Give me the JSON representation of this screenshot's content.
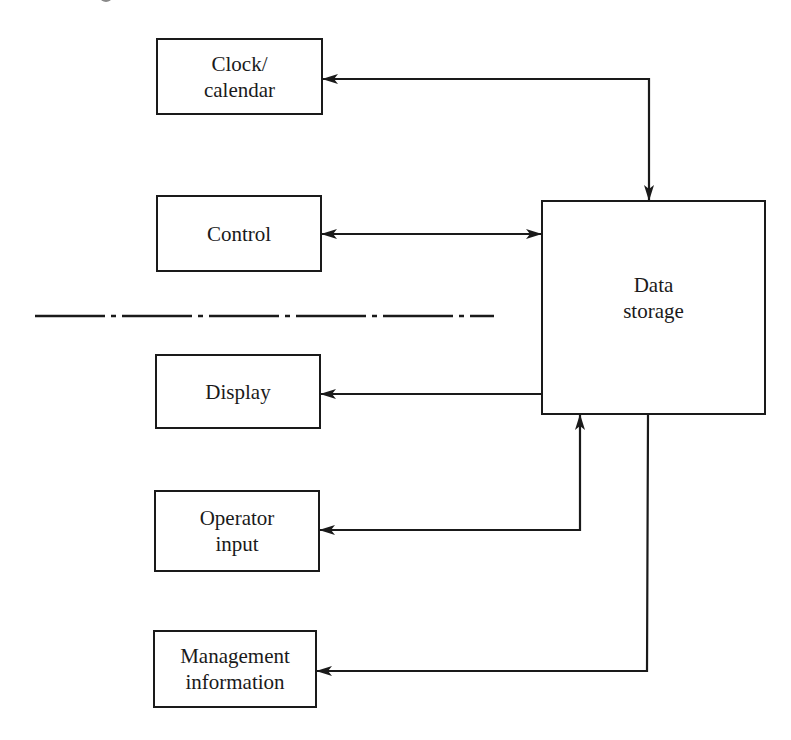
{
  "diagram": {
    "title": "",
    "colors": {
      "stroke": "#1a1a1a",
      "background": "#ffffff"
    },
    "nodes": [
      {
        "id": "clock",
        "lines": [
          "Clock/",
          "calendar"
        ],
        "x": 156,
        "y": 38,
        "w": 167,
        "h": 77
      },
      {
        "id": "control",
        "lines": [
          "Control"
        ],
        "x": 156,
        "y": 195,
        "w": 166,
        "h": 77
      },
      {
        "id": "display",
        "lines": [
          "Display"
        ],
        "x": 155,
        "y": 354,
        "w": 166,
        "h": 75
      },
      {
        "id": "operator",
        "lines": [
          "Operator",
          "input"
        ],
        "x": 154,
        "y": 490,
        "w": 166,
        "h": 82
      },
      {
        "id": "management",
        "lines": [
          "Management",
          "information"
        ],
        "x": 153,
        "y": 630,
        "w": 164,
        "h": 78
      },
      {
        "id": "storage",
        "lines": [
          "Data",
          "storage"
        ],
        "x": 541,
        "y": 200,
        "w": 225,
        "h": 215
      }
    ],
    "edges": [
      {
        "from": "storage",
        "to": "clock",
        "direction": "bidirectional",
        "description": "Clock/calendar <-> Data storage"
      },
      {
        "from": "control",
        "to": "storage",
        "direction": "bidirectional",
        "description": "Control <-> Data storage"
      },
      {
        "from": "storage",
        "to": "display",
        "direction": "forward",
        "description": "Data storage -> Display"
      },
      {
        "from": "operator",
        "to": "storage",
        "direction": "bidirectional",
        "description": "Operator input <-> Data storage"
      },
      {
        "from": "storage",
        "to": "management",
        "direction": "forward",
        "description": "Data storage -> Management information"
      }
    ],
    "separator": {
      "style": "dash-dot",
      "x1": 35,
      "x2": 494,
      "y": 316
    }
  },
  "labels": {
    "clock_line1": "Clock/",
    "clock_line2": "calendar",
    "control": "Control",
    "display": "Display",
    "operator_line1": "Operator",
    "operator_line2": "input",
    "management_line1": "Management",
    "management_line2": "information",
    "storage_line1": "Data",
    "storage_line2": "storage"
  }
}
